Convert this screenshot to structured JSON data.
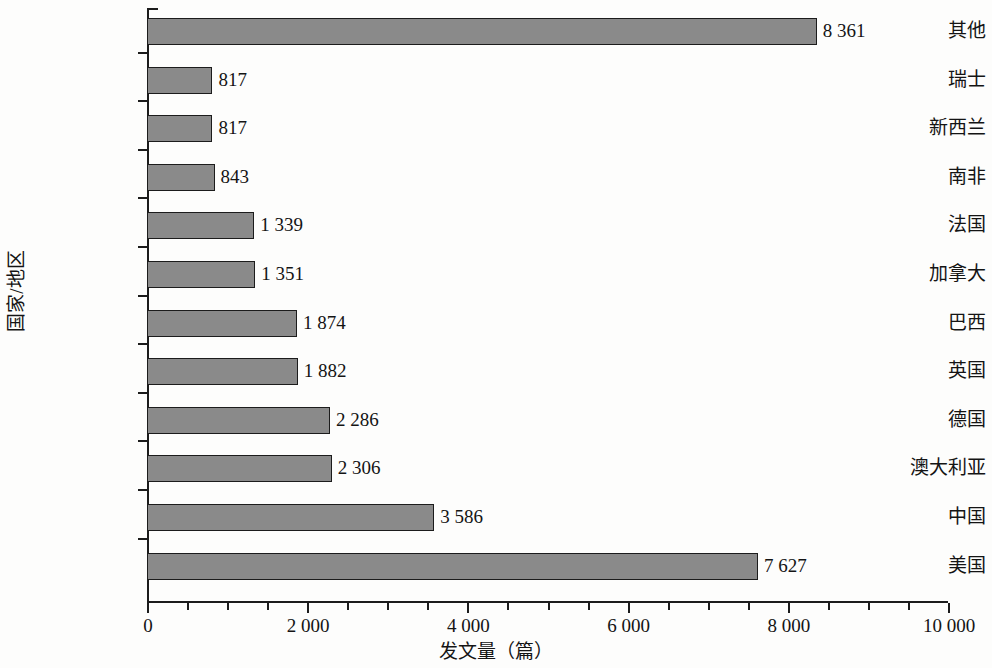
{
  "chart_data": {
    "type": "bar",
    "orientation": "horizontal",
    "title": "",
    "xlabel": "发文量（篇）",
    "ylabel": "国家/地区",
    "xlim": [
      0,
      10000
    ],
    "grid": false,
    "legend": null,
    "x_major_step": 2000,
    "x_minor_step": 500,
    "xticklabels": [
      "0",
      "2 000",
      "4 000",
      "6 000",
      "8 000",
      "10 000"
    ],
    "xtickvalues": [
      0,
      2000,
      4000,
      6000,
      8000,
      10000
    ],
    "categories": [
      "其他",
      "瑞士",
      "新西兰",
      "南非",
      "法国",
      "加拿大",
      "巴西",
      "英国",
      "德国",
      "澳大利亚",
      "中国",
      "美国"
    ],
    "values": [
      8361,
      817,
      817,
      843,
      1339,
      1351,
      1874,
      1882,
      2286,
      2306,
      3586,
      7627
    ],
    "value_labels": [
      "8 361",
      "817",
      "817",
      "843",
      "1 339",
      "1 351",
      "1 874",
      "1 882",
      "2 286",
      "2 306",
      "3 586",
      "7 627"
    ],
    "bar_color": "#8a8a8a",
    "bar_edge_color": "#1c1c1c",
    "axis_color": "#1c1c1c",
    "background_color": "#fdfdfc"
  }
}
